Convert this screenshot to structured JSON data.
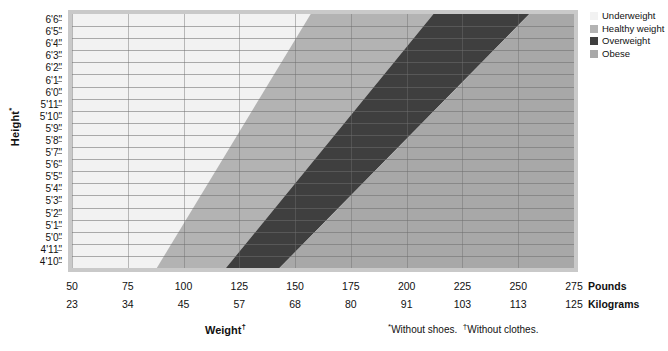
{
  "axes": {
    "y_title": "Height",
    "y_title_marker": "*",
    "x_title": "Weight",
    "x_title_marker": "†",
    "pounds_unit_label": "Pounds",
    "kilograms_unit_label": "Kilograms"
  },
  "footnote": {
    "shoes_marker": "*",
    "shoes_text": "Without shoes.",
    "clothes_marker": "†",
    "clothes_text": "Without clothes."
  },
  "legend": {
    "items": [
      {
        "label": "Underweight",
        "color": "#f2f2f2"
      },
      {
        "label": "Healthy weight",
        "color": "#b3b3b3"
      },
      {
        "label": "Overweight",
        "color": "#3f3f3f"
      },
      {
        "label": "Obese",
        "color": "#a8a8a8"
      }
    ]
  },
  "chart_data": {
    "type": "heatmap",
    "title": "",
    "xlabel": "Weight",
    "ylabel": "Height",
    "grid": true,
    "legend_position": "right",
    "x": [
      50,
      75,
      100,
      125,
      150,
      175,
      200,
      225,
      250,
      275
    ],
    "x_tick_labels": [
      "50",
      "75",
      "100",
      "125",
      "150",
      "175",
      "200",
      "225",
      "250",
      "275"
    ],
    "x_secondary_tick_labels": [
      "23",
      "34",
      "45",
      "57",
      "68",
      "80",
      "91",
      "103",
      "113",
      "125"
    ],
    "xlim": [
      50,
      275
    ],
    "x_unit": "Pounds",
    "x_secondary_unit": "Kilograms",
    "y_tick_labels": [
      "6'6\"",
      "6'5\"",
      "6'4\"",
      "6'3\"",
      "6'2\"",
      "6'1\"",
      "6'0\"",
      "5'11\"",
      "5'10\"",
      "5'9\"",
      "5'8\"",
      "5'7\"",
      "5'6\"",
      "5'5\"",
      "5'4\"",
      "5'3\"",
      "5'2\"",
      "5'1\"",
      "5'0\"",
      "4'11\"",
      "4'10\""
    ],
    "ylim_inches": [
      58,
      78
    ],
    "bands": [
      {
        "name": "Underweight",
        "bmi_range": [
          0,
          18.5
        ],
        "color": "#f2f2f2"
      },
      {
        "name": "Healthy weight",
        "bmi_range": [
          18.5,
          25
        ],
        "color": "#b3b3b3"
      },
      {
        "name": "Overweight",
        "bmi_range": [
          25,
          30
        ],
        "color": "#3f3f3f"
      },
      {
        "name": "Obese",
        "bmi_range": [
          30,
          100
        ],
        "color": "#a8a8a8"
      }
    ],
    "boundaries_lbs": {
      "underweight_healthy": {
        "at_4ft10in": 88,
        "at_6ft6in": 157
      },
      "healthy_overweight": {
        "at_4ft10in": 119,
        "at_6ft6in": 212
      },
      "overweight_obese": {
        "at_4ft10in": 143,
        "at_6ft6in": 255
      }
    }
  }
}
